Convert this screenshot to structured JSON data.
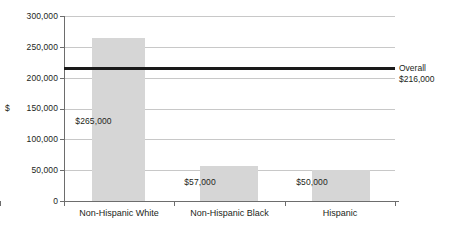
{
  "chart_data": {
    "type": "bar",
    "title": "",
    "subtitle": "",
    "xlabel": "",
    "ylabel": "$",
    "categories": [
      "Non-Hispanic White",
      "Non-Hispanic Black",
      "Hispanic"
    ],
    "values": [
      265000,
      57000,
      50000
    ],
    "value_labels": [
      "$265,000",
      "$57,000",
      "$50,000"
    ],
    "ylim": [
      0,
      300000
    ],
    "ytick_values": [
      0,
      50000,
      100000,
      150000,
      200000,
      250000,
      300000
    ],
    "ytick_labels": [
      "0",
      "50,000",
      "100,000",
      "150,000",
      "200,000",
      "250,000",
      "300,000"
    ],
    "grid": true,
    "legend_position": "right",
    "reference_line": {
      "value": 216000,
      "label_line1": "Overall",
      "label_line2": "$216,000",
      "color": "#1a1a1a"
    },
    "colors": {
      "bar_fill": "#d6d6d6",
      "gridline": "#c8c8c8",
      "axis": "#6d6d6d",
      "text": "#231f20"
    }
  }
}
